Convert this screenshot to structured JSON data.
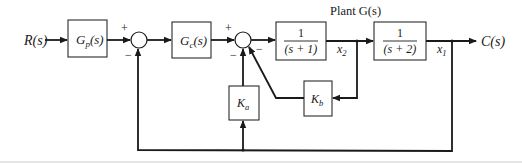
{
  "diagram": {
    "type": "control-system-block-diagram",
    "input": {
      "label": "R(s)"
    },
    "output": {
      "label": "C(s)"
    },
    "plant_title": "Plant G(s)",
    "blocks": {
      "prefilter": {
        "label_main": "G",
        "label_sub": "p",
        "label_arg": "(s)"
      },
      "controller": {
        "label_main": "G",
        "label_sub": "c",
        "label_arg": "(s)"
      },
      "plant1": {
        "numerator": "1",
        "denominator": "(s + 1)"
      },
      "plant2": {
        "numerator": "1",
        "denominator": "(s + 2)"
      },
      "ka": {
        "label_main": "K",
        "label_sub": "a"
      },
      "kb": {
        "label_main": "K",
        "label_sub": "b"
      }
    },
    "signals": {
      "x2": {
        "main": "x",
        "sub": "2"
      },
      "x1": {
        "main": "x",
        "sub": "1"
      }
    },
    "summers": {
      "sum1": {
        "plus": "+",
        "minus": "−"
      },
      "sum2": {
        "plus": "+",
        "minus_left": "−",
        "minus_right": "−"
      }
    }
  }
}
